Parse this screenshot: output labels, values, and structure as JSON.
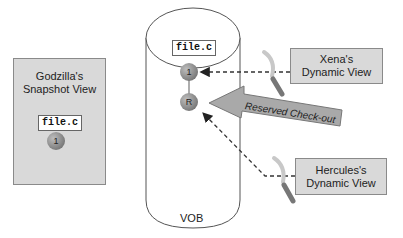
{
  "diagram": {
    "snapshot_view": {
      "title_line1": "Godzilla's",
      "title_line2": "Snapshot View",
      "file_label": "file.c",
      "version_node": "1"
    },
    "vob": {
      "label": "VOB",
      "file_label": "file.c",
      "version_node": "1",
      "reserved_node": "R"
    },
    "xena_view": {
      "title_line1": "Xena's",
      "title_line2": "Dynamic View"
    },
    "hercules_view": {
      "title_line1": "Hercules's",
      "title_line2": "Dynamic View"
    },
    "checkout_arrow": {
      "label": "Reserved Check-out"
    },
    "icons": [
      "magnifier-icon",
      "magnifier-icon"
    ],
    "colors": {
      "box_fill": "#d9d9d9",
      "node_fill": "#8a8a8a",
      "arrow_fill": "#a9a9a9",
      "line": "#555555"
    }
  }
}
